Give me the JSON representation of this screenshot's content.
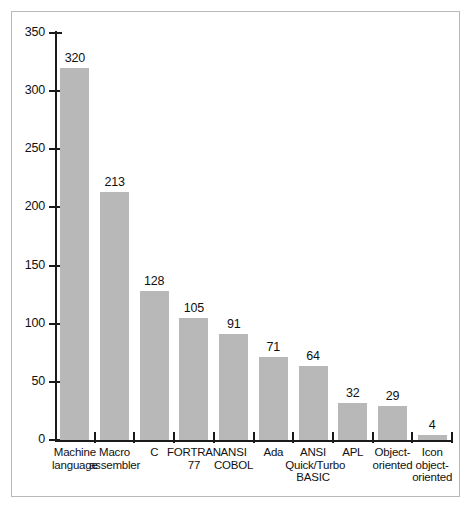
{
  "chart_data": {
    "type": "bar",
    "title": "",
    "subtitle": "",
    "xlabel": "",
    "ylabel": "",
    "ylim": [
      0,
      350
    ],
    "y_ticks": [
      0,
      50,
      100,
      150,
      200,
      250,
      300,
      350
    ],
    "grid": false,
    "legend": null,
    "bar_color": "#b8b8b8",
    "axis_color": "#1a1a1a",
    "background_color": "#ffffff",
    "frame_color": "#b9b9b9",
    "categories": [
      "Machine\nlanguage",
      "Macro\nassembler",
      "C",
      "FORTRAN\n77",
      "ANSI\nCOBOL",
      "Ada",
      "ANSI\nQuick/Turbo\nBASIC",
      "APL",
      "Object-\noriented",
      "Icon\nobject-\noriented"
    ],
    "values": [
      320,
      213,
      128,
      105,
      91,
      71,
      64,
      32,
      29,
      4
    ],
    "value_labels": [
      "320",
      "213",
      "128",
      "105",
      "91",
      "71",
      "64",
      "32",
      "29",
      "4"
    ],
    "tick_labels": [
      "350",
      "300",
      "250",
      "200",
      "150",
      "100",
      "50",
      "0"
    ]
  }
}
